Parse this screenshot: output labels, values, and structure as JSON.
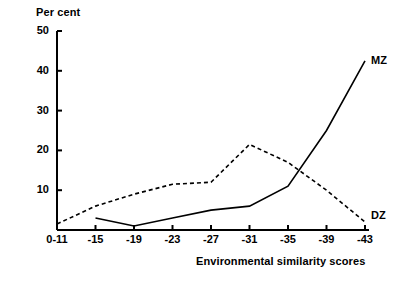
{
  "chart_data": {
    "type": "line",
    "title": "",
    "ylabel": "Per cent",
    "xlabel": "Environmental similarity scores",
    "categories": [
      "0-11",
      "-15",
      "-19",
      "-23",
      "-27",
      "-31",
      "-35",
      "-39",
      "-43"
    ],
    "yticks": [
      0,
      10,
      20,
      30,
      40,
      50
    ],
    "ytick_labels": [
      "",
      "10",
      "20",
      "30",
      "40",
      "50"
    ],
    "ylim": [
      0,
      50
    ],
    "grid": false,
    "legend_position": "inline-right",
    "series": [
      {
        "name": "MZ",
        "style": "solid",
        "color": "#000000",
        "x": [
          "-15",
          "-19",
          "-23",
          "-27",
          "-31",
          "-35",
          "-39",
          "-43"
        ],
        "values": [
          3,
          1,
          3,
          5,
          6,
          11,
          25,
          42.5
        ]
      },
      {
        "name": "DZ",
        "style": "dashed",
        "color": "#000000",
        "x": [
          "0-11",
          "-15",
          "-19",
          "-23",
          "-27",
          "-31",
          "-35",
          "-39",
          "-43"
        ],
        "values": [
          1.5,
          6,
          9,
          11.5,
          12,
          21.5,
          17,
          10,
          2
        ]
      }
    ]
  },
  "labels": {
    "mz": "MZ",
    "dz": "DZ",
    "y_axis_title": "Per cent",
    "x_axis_title": "Environmental similarity scores"
  }
}
